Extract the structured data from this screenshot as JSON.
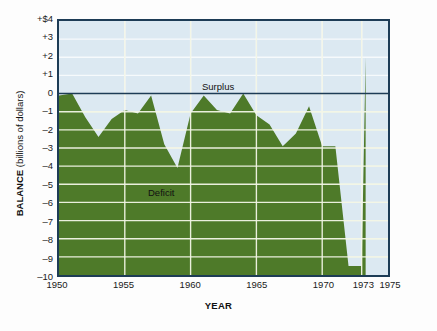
{
  "chart_data": {
    "type": "area",
    "title": "",
    "xlabel": "YEAR",
    "ylabel": "BALANCE (billions of dollars)",
    "ylabel_bold_part": "BALANCE",
    "ylabel_rest": " (billions of dollars)",
    "xlim": [
      1950,
      1975
    ],
    "ylim": [
      -10,
      4
    ],
    "grid": true,
    "grid_color": "#f2f5e6",
    "zero_line": 0,
    "zero_line_color": "#1d3c56",
    "area_color": "#4e7a29",
    "plot_background": "#dce9f2",
    "frame_color": "#1d3c56",
    "legend_position": "none",
    "y_ticks": [
      {
        "value": 4,
        "label": "+$4"
      },
      {
        "value": 3,
        "label": "+3"
      },
      {
        "value": 2,
        "label": "+2"
      },
      {
        "value": 1,
        "label": "+1"
      },
      {
        "value": 0,
        "label": "0"
      },
      {
        "value": -1,
        "label": "–1"
      },
      {
        "value": -2,
        "label": "–2"
      },
      {
        "value": -3,
        "label": "–3"
      },
      {
        "value": -4,
        "label": "–4"
      },
      {
        "value": -5,
        "label": "–5"
      },
      {
        "value": -6,
        "label": "–6"
      },
      {
        "value": -7,
        "label": "–7"
      },
      {
        "value": -8,
        "label": "–8"
      },
      {
        "value": -9,
        "label": "–9"
      },
      {
        "value": -10,
        "label": "–10"
      }
    ],
    "x_ticks": [
      {
        "value": 1950,
        "label": "1950"
      },
      {
        "value": 1955,
        "label": "1955"
      },
      {
        "value": 1960,
        "label": "1960"
      },
      {
        "value": 1965,
        "label": "1965"
      },
      {
        "value": 1970,
        "label": "1970"
      },
      {
        "value": 1973,
        "label": "1973"
      },
      {
        "value": 1975,
        "label": "1975"
      }
    ],
    "x_gridlines": [
      1955,
      1960,
      1965,
      1970,
      1973
    ],
    "annotations": [
      {
        "name": "surplus",
        "text": "Surplus",
        "x": 1965.0,
        "y": 0.55
      },
      {
        "name": "deficit",
        "text": "Deficit",
        "x": 1958.5,
        "y": -5.1
      }
    ],
    "x": [
      1950,
      1951,
      1952,
      1953,
      1954,
      1955,
      1956,
      1957,
      1958,
      1959,
      1960,
      1961,
      1962,
      1963,
      1964,
      1965,
      1966,
      1967,
      1968,
      1969,
      1970,
      1971,
      1972,
      1973,
      1973.3
    ],
    "values": [
      -0.1,
      0.0,
      -1.3,
      -2.4,
      -1.4,
      -0.9,
      -1.1,
      -0.1,
      -2.8,
      -4.1,
      -1.1,
      -0.1,
      -0.9,
      -1.1,
      0.0,
      -1.2,
      -1.7,
      -2.9,
      -2.2,
      -0.7,
      -2.9,
      -2.9,
      -9.5,
      -9.5,
      2.0
    ],
    "series_name": "Balance of payments",
    "units": "billions of dollars"
  }
}
